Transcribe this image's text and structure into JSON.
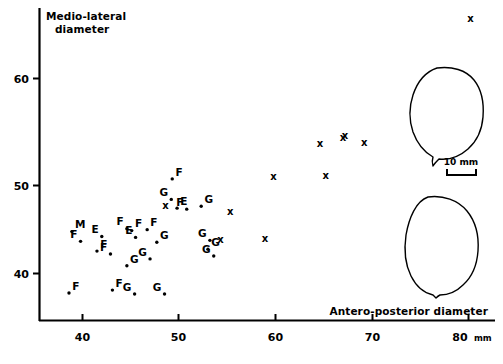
{
  "figure": {
    "background": "#ffffff",
    "ink": "#000000"
  },
  "chart_data": {
    "type": "scatter",
    "title": "",
    "xlabel": "Antero-posterior diameter",
    "ylabel": "Medio-lateral diameter",
    "unit": "mm",
    "unit_label": "80 mm",
    "xlim": [
      36.0,
      81.5
    ],
    "ylim": [
      36.5,
      67.5
    ],
    "xticks": [
      40,
      50,
      60,
      70,
      80
    ],
    "xtick_labels": [
      "40",
      "50",
      "60",
      "70",
      "80"
    ],
    "yticks": [
      40,
      50,
      60
    ],
    "ytick_labels": [
      "40",
      "50",
      "60"
    ],
    "grid": false,
    "legend": "none",
    "marker_note": "Letters (M, F, E, G) and crosses (x) label individual specimens",
    "series": [
      {
        "name": "Lettered specimens",
        "marker": "letter-with-dot",
        "points": [
          {
            "label": "M",
            "x": 38.9,
            "y": 44.3
          },
          {
            "label": "F",
            "x": 39.8,
            "y": 43.3
          },
          {
            "label": "F",
            "x": 38.6,
            "y": 38.0
          },
          {
            "label": "E",
            "x": 42.0,
            "y": 43.8
          },
          {
            "label": "F",
            "x": 41.5,
            "y": 42.3
          },
          {
            "label": "F",
            "x": 42.9,
            "y": 42.0
          },
          {
            "label": "F",
            "x": 43.1,
            "y": 38.3
          },
          {
            "label": "F",
            "x": 44.6,
            "y": 44.6
          },
          {
            "label": "F",
            "x": 45.1,
            "y": 44.4
          },
          {
            "label": "E",
            "x": 45.5,
            "y": 43.7
          },
          {
            "label": "G",
            "x": 44.6,
            "y": 40.8
          },
          {
            "label": "G",
            "x": 45.4,
            "y": 37.9
          },
          {
            "label": "F",
            "x": 46.7,
            "y": 44.5
          },
          {
            "label": "G",
            "x": 47.0,
            "y": 41.5
          },
          {
            "label": "G",
            "x": 47.7,
            "y": 43.2
          },
          {
            "label": "G",
            "x": 48.5,
            "y": 37.9
          },
          {
            "label": "F",
            "x": 49.3,
            "y": 49.7
          },
          {
            "label": "G",
            "x": 49.2,
            "y": 47.6
          },
          {
            "label": "E",
            "x": 49.8,
            "y": 46.7
          },
          {
            "label": "F",
            "x": 50.8,
            "y": 46.6
          },
          {
            "label": "G",
            "x": 52.3,
            "y": 46.9
          },
          {
            "label": "G",
            "x": 53.2,
            "y": 43.4
          },
          {
            "label": "G",
            "x": 53.0,
            "y": 42.5
          },
          {
            "label": "G",
            "x": 53.6,
            "y": 41.8
          }
        ]
      },
      {
        "name": "Cross specimens",
        "marker": "x",
        "points": [
          {
            "x": 48.6,
            "y": 47.0
          },
          {
            "x": 55.3,
            "y": 46.4
          },
          {
            "x": 54.3,
            "y": 43.5
          },
          {
            "x": 58.9,
            "y": 43.6
          },
          {
            "x": 59.8,
            "y": 50.0
          },
          {
            "x": 64.6,
            "y": 53.3
          },
          {
            "x": 67.2,
            "y": 54.2
          },
          {
            "x": 67.0,
            "y": 53.9
          },
          {
            "x": 65.2,
            "y": 50.1
          },
          {
            "x": 69.2,
            "y": 53.4
          },
          {
            "x": 80.2,
            "y": 66.2
          }
        ]
      }
    ],
    "inset_outlines": [
      {
        "name": "upper-femoral-head-outline"
      },
      {
        "name": "lower-femoral-head-outline"
      }
    ],
    "scalebar": {
      "label": "10 mm",
      "length_mm": 10
    }
  }
}
